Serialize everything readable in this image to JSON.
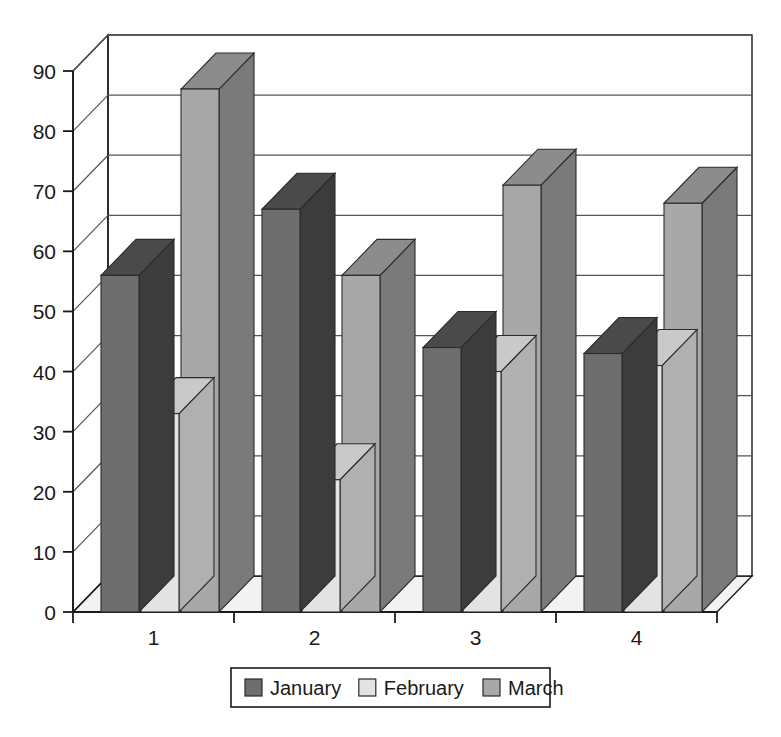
{
  "chart_data": {
    "type": "bar",
    "style": "3d-clustered-column",
    "title": "",
    "subtitle": "",
    "xlabel": "",
    "ylabel": "",
    "categories": [
      "1",
      "2",
      "3",
      "4"
    ],
    "series": [
      {
        "name": "January",
        "color": "#6e6e6e",
        "values": [
          56,
          67,
          44,
          43
        ]
      },
      {
        "name": "February",
        "color": "#e3e3e3",
        "values": [
          33,
          22,
          40,
          41
        ]
      },
      {
        "name": "March",
        "color": "#a8a8a8",
        "values": [
          87,
          56,
          71,
          68
        ]
      }
    ],
    "ylim": [
      0,
      90
    ],
    "yticks": [
      0,
      10,
      20,
      30,
      40,
      50,
      60,
      70,
      80,
      90
    ],
    "ytick_labels": [
      "0",
      "10",
      "20",
      "30",
      "40",
      "50",
      "60",
      "70",
      "80",
      "90"
    ],
    "xtick_labels": [
      "1",
      "2",
      "3",
      "4"
    ],
    "grid": true,
    "grid_axis": "y",
    "legend_position": "bottom",
    "legend_entries": [
      {
        "label": "January",
        "swatch_color": "#6e6e6e"
      },
      {
        "label": "February",
        "swatch_color": "#e3e3e3"
      },
      {
        "label": "March",
        "swatch_color": "#a8a8a8"
      }
    ],
    "colors": {
      "axis": "#1a1a1a",
      "grid": "#555555",
      "background": "#ffffff",
      "january": "#6e6e6e",
      "february": "#e3e3e3",
      "march": "#a8a8a8",
      "january_top": "#4a4a4a",
      "january_side": "#3c3c3c",
      "february_top": "#c9c9c9",
      "february_side": "#b0b0b0",
      "march_top": "#8c8c8c",
      "march_side": "#7a7a7a",
      "floor": "#f2f2f2"
    }
  }
}
